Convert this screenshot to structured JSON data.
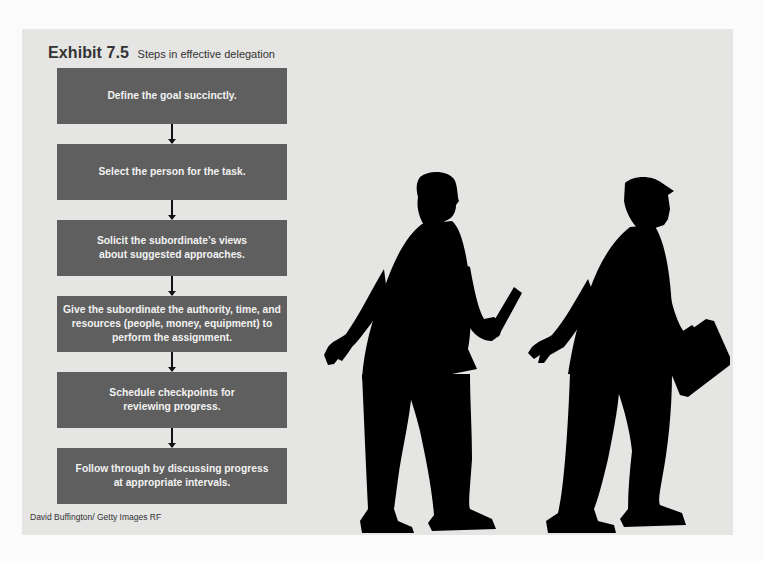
{
  "exhibit": {
    "number": "Exhibit 7.5",
    "subtitle": "Steps in effective delegation"
  },
  "steps": [
    {
      "label": "Define the goal succinctly."
    },
    {
      "label": "Select the person for the task."
    },
    {
      "label": "Solicit the subordinate’s views about suggested approaches."
    },
    {
      "label": "Give the subordinate the authority, time, and resources (people, money, equipment) to perform the assignment."
    },
    {
      "label": "Schedule checkpoints for reviewing progress."
    },
    {
      "label": "Follow through by discussing progress at appropriate intervals."
    }
  ],
  "image": {
    "description": "Silhouettes of two businessmen: one passing a relay baton, one carrying a briefcase",
    "credit": "David Buffington/ Getty Images RF"
  },
  "colors": {
    "panel_bg": "#e5e5e4",
    "step_fill": "#5f5f5f",
    "step_text": "#f2f2f2",
    "arrow": "#111111",
    "silhouette": "#000000"
  }
}
